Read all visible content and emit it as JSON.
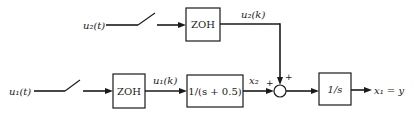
{
  "diagram": {
    "type": "block-diagram",
    "inputs": {
      "u2_t": "u₂(t)",
      "u1_t": "u₁(t)"
    },
    "signals": {
      "u2_k": "u₂(k)",
      "u1_k": "u₁(k)",
      "x2": "x₂",
      "output": "x₁ = y"
    },
    "blocks": {
      "zoh_top": "ZOH",
      "zoh_bottom": "ZOH",
      "first_order": "1/(s + 0.5)",
      "integrator": "1/s"
    },
    "summing_junction": {
      "sign_left": "+",
      "sign_top": "+"
    },
    "colors": {
      "stroke": "#1a1a1a",
      "background": "#ffffff"
    }
  }
}
